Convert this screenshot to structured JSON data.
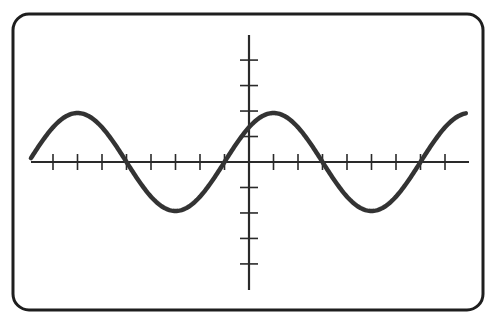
{
  "figure": {
    "colors": {
      "background": "#ffffff",
      "frame": "#1e1e1e",
      "axes": "#2a2a2a",
      "curve": "#333333"
    }
  },
  "chart_data": {
    "type": "line",
    "title": "",
    "xlabel": "",
    "ylabel": "",
    "grid": false,
    "legend": null,
    "x_ticks_count_left_of_origin": 9,
    "x_ticks_count_right_of_origin": 8,
    "y_ticks_count_above_origin": 4,
    "y_ticks_count_below_origin": 4,
    "tick_labels": [],
    "tick_spacing_units": 1,
    "units_per_x_tick": 1,
    "units_per_y_tick": 1,
    "xlim": [
      -8.9,
      8.8
    ],
    "ylim": [
      -5,
      5
    ],
    "series": [
      {
        "name": "sine wave",
        "function": "y = A*sin(2*pi*(x - x0)/T)",
        "amplitude": 2,
        "period": 8,
        "phase_zero_crossing_x": -1,
        "x": [
          -8.8,
          -7,
          -5,
          -3,
          -1,
          1,
          3,
          5,
          7,
          8.8
        ],
        "y": [
          -0.2,
          2,
          0,
          -2,
          0,
          2,
          0,
          -2,
          0,
          1.9
        ]
      }
    ]
  }
}
